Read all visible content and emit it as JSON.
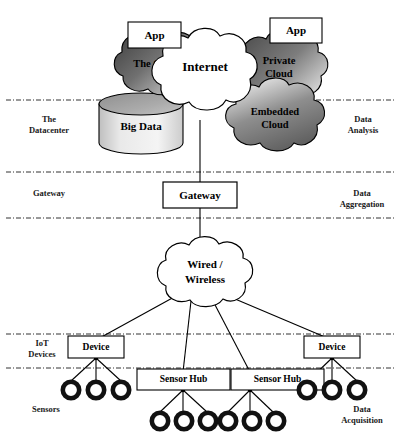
{
  "diagram": {
    "type": "layered-block-diagram",
    "background_color": "#ffffff",
    "stroke_color": "#000000"
  },
  "left_labels": [
    {
      "id": "datacenter",
      "text": "The\nDatacenter"
    },
    {
      "id": "gateway",
      "text": "Gateway"
    },
    {
      "id": "iot-devices",
      "text": "IoT\nDevices"
    },
    {
      "id": "sensors",
      "text": "Sensors"
    }
  ],
  "right_labels": [
    {
      "id": "data-analysis",
      "text": "Data\nAnalysis"
    },
    {
      "id": "data-aggregation",
      "text": "Data\nAggregation"
    },
    {
      "id": "data-acquisition",
      "text": "Data\nAcquisition"
    }
  ],
  "nodes": {
    "app_left": {
      "label": "App",
      "shape": "rect",
      "fill": "#ffffff"
    },
    "app_right": {
      "label": "App",
      "shape": "rect",
      "fill": "#ffffff"
    },
    "the_cloud": {
      "label": "The Cloud",
      "shape": "cloud",
      "fill": "#6e6e6e"
    },
    "internet": {
      "label": "Internet",
      "shape": "cloud",
      "fill": "#ffffff"
    },
    "private_cloud": {
      "label": "Private\nCloud",
      "shape": "cloud",
      "fill": "#7a7a7a"
    },
    "embedded_cloud": {
      "label": "Embedded\nCloud",
      "shape": "cloud",
      "fill": "#8c8c8c"
    },
    "big_data": {
      "label": "Big Data",
      "shape": "cylinder",
      "fill": "#d8d8d8"
    },
    "gateway": {
      "label": "Gateway",
      "shape": "rect",
      "fill": "#ffffff"
    },
    "wired_wireless": {
      "label": "Wired /\nWireless",
      "shape": "cloud",
      "fill": "#ffffff"
    },
    "device_left": {
      "label": "Device",
      "shape": "rect",
      "fill": "#ffffff"
    },
    "device_right": {
      "label": "Device",
      "shape": "rect",
      "fill": "#ffffff"
    },
    "sensor_hub_1": {
      "label": "Sensor Hub",
      "shape": "rect",
      "fill": "#ffffff"
    },
    "sensor_hub_2": {
      "label": "Sensor Hub",
      "shape": "rect",
      "fill": "#ffffff"
    }
  },
  "node_text": {
    "app_left": "App",
    "app_right": "App",
    "the_cloud": "The Cloud",
    "internet": "Internet",
    "private_cloud_l1": "Private",
    "private_cloud_l2": "Cloud",
    "embedded_cloud_l1": "Embedded",
    "embedded_cloud_l2": "Cloud",
    "big_data": "Big Data",
    "gateway": "Gateway",
    "wired_l1": "Wired /",
    "wired_l2": "Wireless",
    "device_left": "Device",
    "device_right": "Device",
    "sensor_hub_1": "Sensor Hub",
    "sensor_hub_2": "Sensor Hub"
  },
  "sensor_groups": [
    {
      "id": "sensors-device-left",
      "parent": "device_left",
      "count": 3
    },
    {
      "id": "sensors-hub-1",
      "parent": "sensor_hub_1",
      "count": 3
    },
    {
      "id": "sensors-hub-2",
      "parent": "sensor_hub_2",
      "count": 3
    },
    {
      "id": "sensors-device-right",
      "parent": "device_right",
      "count": 3
    }
  ],
  "dividers": [
    {
      "id": "divider-datacenter-analysis",
      "y": 100,
      "style": "dash-dot"
    },
    {
      "id": "divider-gateway-top",
      "y": 172,
      "style": "dash-dot"
    },
    {
      "id": "divider-gateway-bottom",
      "y": 218,
      "style": "dash-dot"
    },
    {
      "id": "divider-iot-devices-top",
      "y": 334,
      "style": "dash-dot"
    },
    {
      "id": "divider-sensors-top",
      "y": 368,
      "style": "dash-dot"
    }
  ],
  "colors": {
    "stroke": "#000000",
    "cloud_dark_edge": "#4a4a4a",
    "cloud_light_center": "#e8e8e8",
    "cylinder_top": "#9a9a9a",
    "cylinder_body": "#d0d0d0",
    "divider": "#333333",
    "text": "#111111"
  }
}
